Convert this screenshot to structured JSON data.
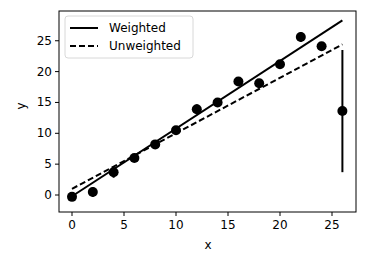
{
  "chart_data": {
    "type": "scatter",
    "title": "",
    "xlabel": "x",
    "ylabel": "y",
    "xlim": [
      -1.3,
      27.3
    ],
    "ylim": [
      -2.7,
      29.3
    ],
    "xticks": [
      0,
      5,
      10,
      15,
      20,
      25
    ],
    "yticks": [
      0,
      5,
      10,
      15,
      20,
      25
    ],
    "grid": false,
    "legend_position": "upper left",
    "points": {
      "name": "data",
      "x": [
        0,
        2,
        4,
        6,
        8,
        10,
        12,
        14,
        16,
        18,
        20,
        22,
        24,
        26
      ],
      "y": [
        -0.3,
        0.5,
        3.7,
        6.0,
        8.2,
        10.5,
        13.9,
        15.0,
        18.4,
        18.1,
        21.2,
        25.6,
        24.1,
        13.6
      ],
      "yerr": [
        0.6,
        0.8,
        0.9,
        0.6,
        0.6,
        0.7,
        0.8,
        0.7,
        0.6,
        0.7,
        0.6,
        0.8,
        0.7,
        9.9
      ]
    },
    "series": [
      {
        "name": "Weighted",
        "style": "solid",
        "x": [
          0,
          26
        ],
        "y": [
          -0.2,
          28.3
        ]
      },
      {
        "name": "Unweighted",
        "style": "dashed",
        "x": [
          0,
          26
        ],
        "y": [
          1.0,
          24.4
        ]
      }
    ],
    "legend": [
      "Weighted",
      "Unweighted"
    ]
  }
}
